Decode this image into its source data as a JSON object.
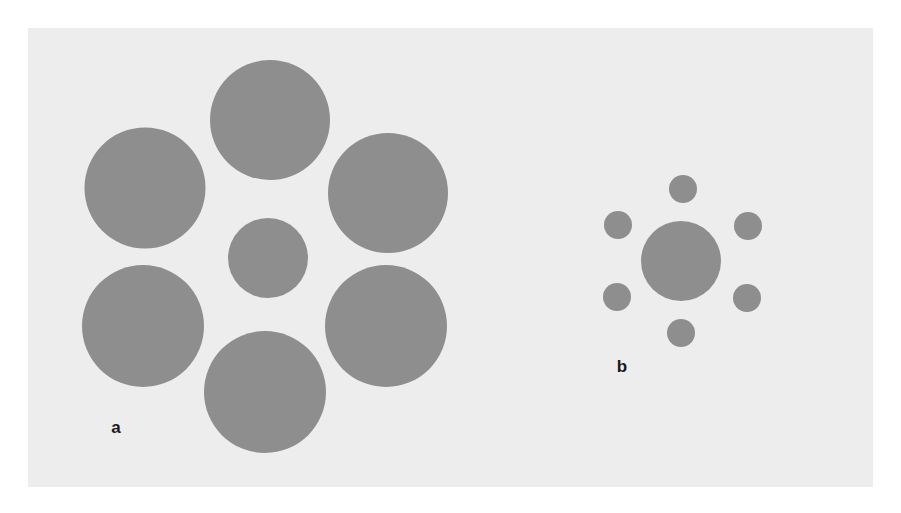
{
  "figure": {
    "colors": {
      "background": "#ffffff",
      "panel": "#ededed",
      "circle": "#8e8e8e",
      "label": "#1a1a1a"
    },
    "panels": [
      {
        "label": "a",
        "label_pos": [
          116,
          428
        ],
        "center_circle": {
          "cx": 268,
          "cy": 258,
          "d": 80
        },
        "surround_circles": [
          {
            "cx": 270,
            "cy": 120,
            "d": 120
          },
          {
            "cx": 145,
            "cy": 188,
            "d": 121
          },
          {
            "cx": 388,
            "cy": 193,
            "d": 120
          },
          {
            "cx": 143,
            "cy": 326,
            "d": 122
          },
          {
            "cx": 386,
            "cy": 326,
            "d": 122
          },
          {
            "cx": 265,
            "cy": 392,
            "d": 122
          }
        ]
      },
      {
        "label": "b",
        "label_pos": [
          622,
          367
        ],
        "center_circle": {
          "cx": 681,
          "cy": 261,
          "d": 80
        },
        "surround_circles": [
          {
            "cx": 683,
            "cy": 189,
            "d": 28
          },
          {
            "cx": 618,
            "cy": 225,
            "d": 28
          },
          {
            "cx": 748,
            "cy": 226,
            "d": 28
          },
          {
            "cx": 617,
            "cy": 297,
            "d": 28
          },
          {
            "cx": 747,
            "cy": 298,
            "d": 28
          },
          {
            "cx": 681,
            "cy": 333,
            "d": 28
          }
        ]
      }
    ]
  },
  "labels": {
    "a": "a",
    "b": "b"
  }
}
